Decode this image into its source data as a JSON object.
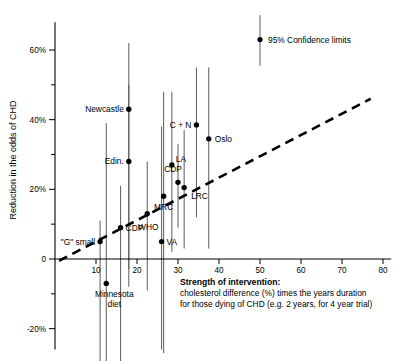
{
  "chart_data": {
    "type": "scatter",
    "title": "",
    "xlabel": "Strength of intervention: cholesterol difference (%) times the years duration for those dying of CHD (e.g. 2 years, for 4 year trial)",
    "ylabel": "Reduction in the odds of CHD",
    "xlim": [
      0,
      82
    ],
    "ylim": [
      -26,
      68
    ],
    "grid": false,
    "legend_position": "top-right",
    "xticks": [
      10,
      20,
      30,
      40,
      50,
      60,
      70,
      80
    ],
    "xticklabels": [
      "10",
      "20",
      "30",
      "40",
      "50",
      "60",
      "70",
      "80"
    ],
    "yticks": [
      -20,
      -10,
      0,
      10,
      20,
      30,
      40,
      50,
      60
    ],
    "yticklabels": [
      "-20%",
      "",
      "0",
      "",
      "20%",
      "",
      "40%",
      "",
      "60%"
    ],
    "legend": [
      {
        "label": "95% Confidence limits",
        "x": 50.0,
        "y": 63.0,
        "low": 55.5,
        "high": 70.0
      }
    ],
    "trendline": {
      "style": "dashed",
      "x_start": 1.0,
      "y_start": -0.5,
      "x_end": 77.0,
      "y_end": 46.0
    },
    "points": [
      {
        "name": "\"G\" small",
        "x": 11.0,
        "y": 5.0,
        "ci_low": -58.0,
        "ci_high": 11.0,
        "label_side": "left"
      },
      {
        "name": "CDP",
        "x": 16.0,
        "y": 9.0,
        "ci_low": -30.0,
        "ci_high": 21.0,
        "label_side": "right"
      },
      {
        "name": "Minnesota diet",
        "x": 12.5,
        "y": -7.0,
        "ci_low": -57.0,
        "ci_high": 39.0,
        "label_side": "below"
      },
      {
        "name": "Newcastle",
        "x": 18.0,
        "y": 43.0,
        "ci_low": -3.0,
        "ci_high": 62.0,
        "label_side": "left"
      },
      {
        "name": "Edin.",
        "x": 18.0,
        "y": 28.0,
        "ci_low": -8.0,
        "ci_high": 50.0,
        "label_side": "left"
      },
      {
        "name": "WHO",
        "x": 22.5,
        "y": 13.0,
        "ci_low": -9.0,
        "ci_high": 28.0,
        "label_side": "below"
      },
      {
        "name": "VA",
        "x": 26.0,
        "y": 5.0,
        "ci_low": -26.0,
        "ci_high": 38.0,
        "label_side": "right"
      },
      {
        "name": "MRC",
        "x": 26.5,
        "y": 18.0,
        "ci_low": -27.0,
        "ci_high": 48.0,
        "label_side": "below"
      },
      {
        "name": "LA",
        "x": 28.5,
        "y": 27.0,
        "ci_low": 2.0,
        "ci_high": 48.0,
        "label_side": "right"
      },
      {
        "name": "CDP",
        "x": 30.0,
        "y": 22.0,
        "ci_low": 9.0,
        "ci_high": 33.0,
        "label_side": "above"
      },
      {
        "name": "LRC",
        "x": 31.5,
        "y": 20.5,
        "ci_low": 3.0,
        "ci_high": 37.0,
        "label_side": "right"
      },
      {
        "name": "C + N",
        "x": 34.5,
        "y": 38.5,
        "ci_low": 12.0,
        "ci_high": 55.0,
        "label_side": "left"
      },
      {
        "name": "Oslo",
        "x": 37.5,
        "y": 34.5,
        "ci_low": 3.0,
        "ci_high": 55.0,
        "label_side": "right"
      }
    ]
  },
  "axis": {
    "y_title": "Reduction in the odds of CHD",
    "y_tick_60": "60%",
    "y_tick_40": "40%",
    "y_tick_20": "20%",
    "y_tick_0": "0",
    "y_tick_neg20": "-20%",
    "x_tick_10": "10",
    "x_tick_20": "20",
    "x_tick_30": "30",
    "x_tick_40": "40",
    "x_tick_50": "50",
    "x_tick_60": "60",
    "x_tick_70": "70",
    "x_tick_80": "80"
  },
  "legend": {
    "confidence_label": "95% Confidence limits"
  },
  "caption": {
    "heading": "Strength of intervention:",
    "line1": "cholesterol difference (%) times the years duration",
    "line2": "for those dying of CHD (e.g. 2 years, for 4 year trial)"
  },
  "point_labels": {
    "g_small": "\"G\" small",
    "cdp_low": "CDP",
    "minnesota_line1": "Minnesota",
    "minnesota_line2": "diet",
    "newcastle": "Newcastle",
    "edin": "Edin.",
    "who": "WHO",
    "va": "VA",
    "mrc": "MRC",
    "la": "LA",
    "cdp_mid": "CDP",
    "lrc": "LRC",
    "cn": "C + N",
    "oslo": "Oslo"
  },
  "colors": {
    "axis": "#000000",
    "point": "#000000",
    "errorbar": "#5a5a5a",
    "trend": "#000000",
    "background": "#ffffff"
  }
}
